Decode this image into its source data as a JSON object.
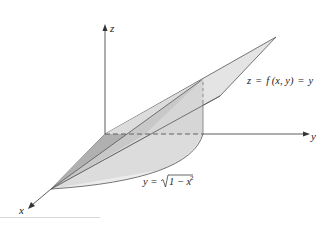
{
  "figure": {
    "type": "3d-surface-diagram",
    "axes": {
      "x_label": "x",
      "y_label": "y",
      "z_label": "z"
    },
    "surface_label": {
      "lhs": "z",
      "eq1": "=",
      "func": "f",
      "args": "(x, y)",
      "eq2": "=",
      "rhs": "y"
    },
    "curve_label": {
      "lhs": "y",
      "eq": "=",
      "radicand": "1 − x",
      "exponent": "2"
    },
    "colors": {
      "axis": "#333333",
      "plane_fill": "#e6e6e6",
      "plane_stroke": "#555555",
      "dark_face": "#b4b4b4",
      "mid_face": "#cfcfcf",
      "base_region": "#ededed",
      "dashed": "#666666"
    }
  }
}
